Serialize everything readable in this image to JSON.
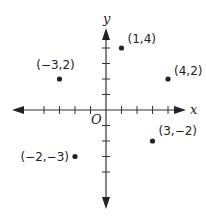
{
  "chart_data": {
    "type": "scatter",
    "title": "",
    "xlabel": "x",
    "ylabel": "y",
    "origin_label": "O",
    "xlim": [
      -6,
      5
    ],
    "ylim": [
      -6,
      5
    ],
    "grid": false,
    "ticks": {
      "x": [
        -4,
        -3,
        -2,
        -1,
        1,
        2,
        3,
        4
      ],
      "y": [
        -4,
        -3,
        -2,
        -1,
        1,
        2,
        3,
        4
      ]
    },
    "points": [
      {
        "x": 1,
        "y": 4,
        "label": "(1,4)"
      },
      {
        "x": -3,
        "y": 2,
        "label": "(−3,2)"
      },
      {
        "x": 4,
        "y": 2,
        "label": "(4,2)"
      },
      {
        "x": 3,
        "y": -2,
        "label": "(3,−2)"
      },
      {
        "x": -2,
        "y": -3,
        "label": "(−2,−3)"
      }
    ]
  },
  "colors": {
    "ink": "#222222",
    "background": "#ffffff"
  }
}
